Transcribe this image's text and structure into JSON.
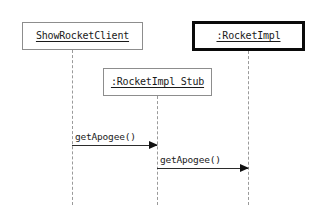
{
  "diagram": {
    "type": "uml-sequence-diagram",
    "width": 322,
    "height": 211,
    "background_color": "#ffffff",
    "participants": [
      {
        "id": "client",
        "label": "ShowRocketClient",
        "underlined": true,
        "border_style": "thin",
        "border_color": "#8d8d8d",
        "x": 22,
        "y": 22,
        "width": 121,
        "height": 28,
        "lifeline_x": 72,
        "lifeline_top": 50,
        "lifeline_bottom": 205
      },
      {
        "id": "stub",
        "label": ":RocketImpl_Stub",
        "underlined": true,
        "border_style": "thin",
        "border_color": "#8d8d8d",
        "x": 103,
        "y": 68,
        "width": 109,
        "height": 28,
        "lifeline_x": 157,
        "lifeline_top": 96,
        "lifeline_bottom": 205
      },
      {
        "id": "impl",
        "label": ":RocketImpl",
        "underlined": true,
        "border_style": "thick",
        "border_color": "#0a0a0a",
        "x": 192,
        "y": 21,
        "width": 113,
        "height": 30,
        "lifeline_x": 248,
        "lifeline_top": 51,
        "lifeline_bottom": 205
      }
    ],
    "messages": [
      {
        "id": "msg-1",
        "label": "getApogee()",
        "from": "client",
        "to": "stub",
        "arrow": "solid-filled",
        "x": 72,
        "y": 145,
        "width": 85,
        "label_color": "#1a1a1a",
        "line_color": "#2b2b2b"
      },
      {
        "id": "msg-2",
        "label": "getApogee()",
        "from": "stub",
        "to": "impl",
        "arrow": "solid-filled",
        "x": 157,
        "y": 168,
        "width": 91,
        "label_color": "#1a1a1a",
        "line_color": "#2b2b2b"
      }
    ]
  }
}
